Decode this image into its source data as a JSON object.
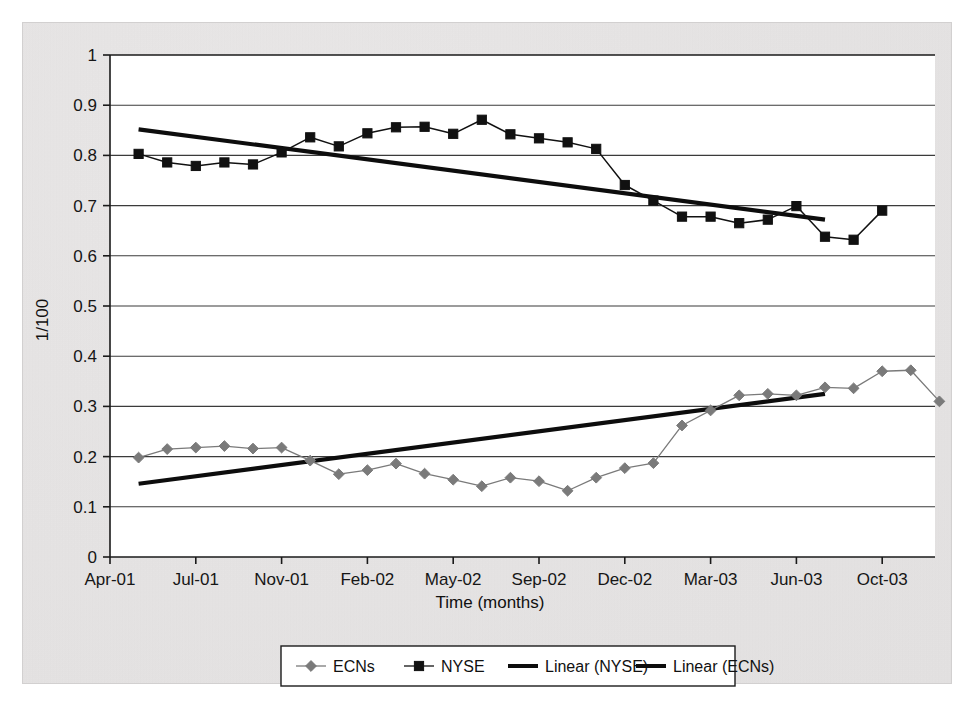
{
  "chart_data": {
    "type": "line",
    "title": "",
    "xlabel": "Time (months)",
    "ylabel": "1/100",
    "grid": true,
    "legend_position": "bottom",
    "ylim": [
      0,
      1
    ],
    "ytick_labels": [
      "1",
      "0.9",
      "0.8",
      "0.7",
      "0.6",
      "0.5",
      "0.4",
      "0.3",
      "0.2",
      "0.1",
      "0"
    ],
    "ytick_values": [
      1,
      0.9,
      0.8,
      0.7,
      0.6,
      0.5,
      0.4,
      0.3,
      0.2,
      0.1,
      0
    ],
    "xtick_labels": [
      "Apr-01",
      "Jul-01",
      "Nov-01",
      "Feb-02",
      "May-02",
      "Sep-02",
      "Dec-02",
      "Mar-03",
      "Jun-03",
      "Oct-03"
    ],
    "x_months": [
      "May-01",
      "Jun-01",
      "Jul-01",
      "Aug-01",
      "Sep-01",
      "Oct-01",
      "Nov-01",
      "Dec-01",
      "Jan-02",
      "Feb-02",
      "Mar-02",
      "Apr-02",
      "May-02",
      "Jun-02",
      "Jul-02",
      "Aug-02",
      "Sep-02",
      "Oct-02",
      "Nov-02",
      "Dec-02",
      "Jan-03",
      "Feb-03",
      "Mar-03",
      "Apr-03",
      "May-03"
    ],
    "series": [
      {
        "name": "ECNs",
        "marker": "diamond",
        "color": "#7a7a7a",
        "values": [
          0.198,
          0.215,
          0.218,
          0.221,
          0.216,
          0.218,
          0.192,
          0.165,
          0.173,
          0.186,
          0.166,
          0.154,
          0.141,
          0.158,
          0.151,
          0.132,
          0.158,
          0.177,
          0.187,
          0.262,
          0.292,
          0.322,
          0.325,
          0.322,
          0.338
        ]
      },
      {
        "name": "NYSE",
        "marker": "square",
        "color": "#111111",
        "values": [
          0.803,
          0.786,
          0.779,
          0.786,
          0.782,
          0.806,
          0.836,
          0.818,
          0.844,
          0.856,
          0.857,
          0.843,
          0.871,
          0.842,
          0.834,
          0.826,
          0.813,
          0.741,
          0.71,
          0.678,
          0.678,
          0.665,
          0.672,
          0.699,
          0.638
        ]
      }
    ],
    "extra_points": {
      "ECNs_tail": [
        0.336,
        0.37,
        0.372,
        0.31
      ],
      "NYSE_tail": [
        0.632,
        0.69
      ]
    },
    "trendlines": [
      {
        "name": "Linear (NYSE)",
        "color": "#0d0d0d",
        "x_start_month": 0,
        "x_end_month": 24,
        "y_start": 0.852,
        "y_end": 0.672
      },
      {
        "name": "Linear (ECNs)",
        "color": "#0d0d0d",
        "x_start_month": 0,
        "x_end_month": 24,
        "y_start": 0.146,
        "y_end": 0.325
      }
    ],
    "legend": [
      {
        "label": "ECNs",
        "marker": "diamond",
        "color": "#7a7a7a",
        "type": "line-marker"
      },
      {
        "label": "NYSE",
        "marker": "square",
        "color": "#111111",
        "type": "line-marker"
      },
      {
        "label": "Linear (NYSE)",
        "marker": "none",
        "color": "#0d0d0d",
        "type": "line-thick"
      },
      {
        "label": "Linear (ECNs)",
        "marker": "none",
        "color": "#0d0d0d",
        "type": "line-thick"
      }
    ]
  },
  "colors": {
    "paper": "#e9e7e7",
    "plot_background": "#ffffff",
    "axis": "#1a1a1a",
    "gridline": "#3b3b3b",
    "ecn_series": "#7a7a7a",
    "nyse_series": "#111111",
    "trendline": "#0d0d0d"
  }
}
